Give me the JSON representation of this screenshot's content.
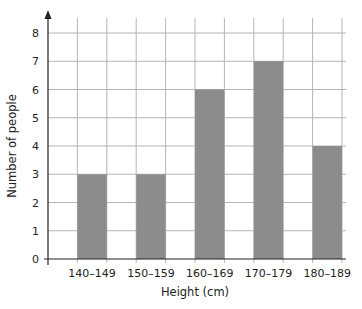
{
  "chart_data": {
    "type": "bar",
    "title": "",
    "xlabel": "Height (cm)",
    "ylabel": "Number of people",
    "categories": [
      "140–149",
      "150–159",
      "160–169",
      "170–179",
      "180–189"
    ],
    "values": [
      3,
      3,
      6,
      7,
      4
    ],
    "ylim": [
      0,
      8
    ],
    "yticks": [
      "0",
      "1",
      "2",
      "3",
      "4",
      "5",
      "6",
      "7",
      "8"
    ],
    "grid": true,
    "legend": "none",
    "bar_color": "#8c8c8c",
    "grid_color": "#b5b5b5",
    "axis_color": "#222222"
  }
}
